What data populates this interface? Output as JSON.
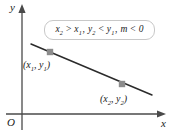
{
  "figure": {
    "type": "coordinate-plane-line-diagram",
    "axes": {
      "x_label": "x",
      "y_label": "y",
      "origin_label": "O"
    },
    "formula_box": {
      "text": "x₂ > x₁, y₂ < y₁, m < 0",
      "parts": [
        {
          "var": "x",
          "sub": "2",
          "op": ">"
        },
        {
          "var": "x",
          "sub": "1",
          "op": ","
        },
        {
          "var": "y",
          "sub": "2",
          "op": "<"
        },
        {
          "var": "y",
          "sub": "1",
          "op": ","
        },
        {
          "var": "m",
          "sub": "",
          "op": "<"
        },
        {
          "var": "0",
          "sub": "",
          "op": ""
        }
      ],
      "border_color": "#c8c8c8"
    },
    "points": [
      {
        "name": "point-1",
        "label": "(x₁, y₁)",
        "marker_color": "#8c8c8c",
        "cx": 50,
        "cy": 52
      },
      {
        "name": "point-2",
        "label": "(x₂, y₂)",
        "marker_color": "#8c8c8c",
        "cx": 122,
        "cy": 84
      }
    ],
    "line": {
      "name": "negative-slope-line",
      "color": "#2b2b2b",
      "x1": 31,
      "y1": 44,
      "x2": 152,
      "y2": 95,
      "slope_sign": "negative"
    },
    "colors": {
      "axis": "#4a4a4a",
      "line": "#2b2b2b",
      "marker": "#8c8c8c",
      "text": "#1a1a1a",
      "background": "#ffffff"
    }
  }
}
